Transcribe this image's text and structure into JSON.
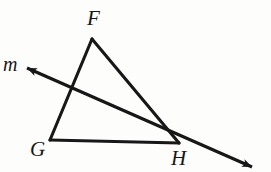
{
  "figure": {
    "kind": "geometry-diagram",
    "width": 271,
    "height": 172,
    "background_color": "#fdfdfc",
    "stroke_color": "#171717",
    "stroke_width": 3.1
  },
  "labels": {
    "F": "F",
    "G": "G",
    "H": "H",
    "m": "m"
  },
  "points": {
    "F": {
      "x": 92,
      "y": 39
    },
    "G": {
      "x": 50,
      "y": 140
    },
    "H": {
      "x": 179,
      "y": 143
    },
    "m_arrow_upper_left": {
      "x": 27,
      "y": 68
    },
    "m_arrow_lower_right": {
      "x": 252,
      "y": 167
    },
    "m_intersects_FG": {
      "x": 70,
      "y": 93
    }
  },
  "segments": [
    {
      "name": "FG",
      "from": "F",
      "to": "G"
    },
    {
      "name": "FH",
      "from": "F",
      "to": "H"
    },
    {
      "name": "GH",
      "from": "G",
      "to": "H"
    }
  ],
  "lines": [
    {
      "name": "m",
      "label": "m",
      "from": "m_arrow_upper_left",
      "to": "m_arrow_lower_right",
      "arrowheads": [
        "start",
        "end"
      ]
    }
  ]
}
